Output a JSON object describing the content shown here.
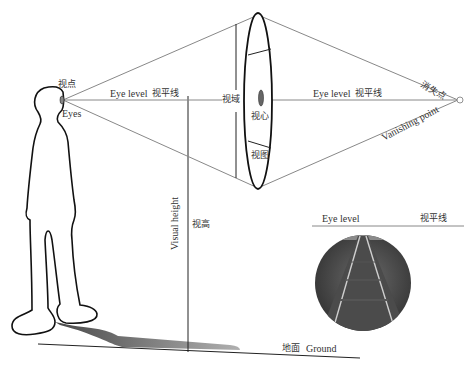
{
  "figure": {
    "labels": {
      "viewpoint_cn": "视点",
      "eyes": "Eyes",
      "eye_level_main": "Eye level",
      "eye_level_main_cn": "视平线",
      "field_of_view_cn": "视域",
      "visual_center_cn": "视心",
      "picture_plane_cn": "视图",
      "eye_level_right": "Eye level",
      "eye_level_right_cn": "视平线",
      "vanishing_point_cn": "消失点",
      "vanishing_point": "Vanishing point",
      "visual_height": "Visual height",
      "visual_height_cn": "视高",
      "ground_cn": "地面",
      "ground": "Ground",
      "inset_eye_level": "Eye level",
      "inset_eye_level_cn": "视平线"
    },
    "colors": {
      "line": "#222222",
      "ray": "#888888",
      "shadow_dark": "#555555",
      "shadow_light": "#aaaaaa",
      "photo_dark": "#3a3a3a"
    }
  }
}
